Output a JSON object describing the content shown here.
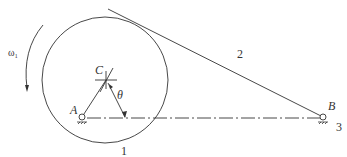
{
  "labels": {
    "omega": "ω₁",
    "C": "C",
    "theta": "θ",
    "A": "A",
    "B": "B",
    "one": "1",
    "two": "2",
    "three": "3"
  },
  "colors": {
    "stroke": "#333333"
  }
}
